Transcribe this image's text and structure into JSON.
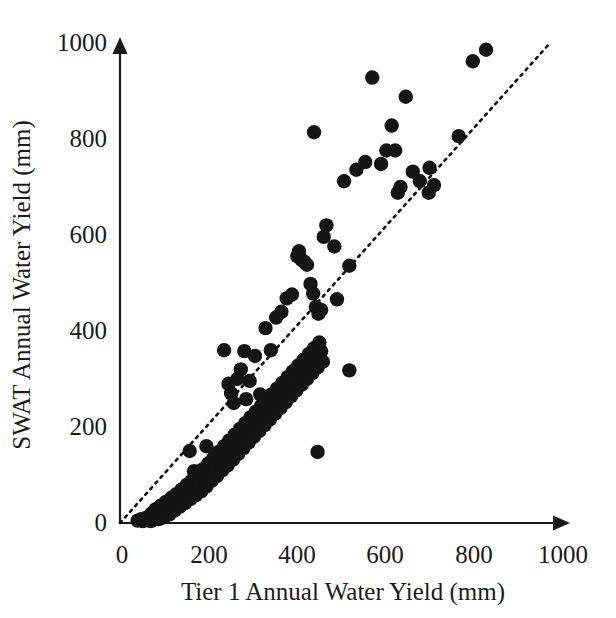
{
  "figure": {
    "background_color": "#ffffff",
    "point_color": "#151515",
    "axis_color": "#1a1a1a",
    "line_color": "#111111"
  },
  "axes": {
    "x_title": "Tier 1 Annual Water Yield (mm)",
    "y_title": "SWAT Annual Water Yield (mm)",
    "x_ticks": [
      "0",
      "200",
      "400",
      "600",
      "800",
      "1000"
    ],
    "y_ticks": [
      "0",
      "200",
      "400",
      "600",
      "800",
      "1000"
    ]
  },
  "chart_data": {
    "type": "scatter",
    "title": "",
    "xlabel": "Tier 1 Annual Water Yield (mm)",
    "ylabel": "SWAT Annual Water Yield (mm)",
    "xlim": [
      0,
      1000
    ],
    "ylim": [
      0,
      1000
    ],
    "xticks": [
      0,
      200,
      400,
      600,
      800,
      1000
    ],
    "yticks": [
      0,
      200,
      400,
      600,
      800,
      1000
    ],
    "grid": false,
    "legend": null,
    "annotations": [
      {
        "name": "one-to-one-line",
        "style": "dotted",
        "from": [
          0,
          0
        ],
        "to": [
          975,
          1000
        ]
      }
    ],
    "series": [
      {
        "name": "Watershed annual water yield",
        "marker": "filled-circle",
        "color": "#151515",
        "points": [
          [
            40,
            5
          ],
          [
            48,
            8
          ],
          [
            52,
            4
          ],
          [
            58,
            10
          ],
          [
            62,
            6
          ],
          [
            66,
            14
          ],
          [
            70,
            4
          ],
          [
            72,
            20
          ],
          [
            76,
            10
          ],
          [
            80,
            28
          ],
          [
            84,
            16
          ],
          [
            88,
            8
          ],
          [
            92,
            36
          ],
          [
            96,
            22
          ],
          [
            100,
            12
          ],
          [
            104,
            44
          ],
          [
            108,
            30
          ],
          [
            112,
            18
          ],
          [
            116,
            52
          ],
          [
            120,
            38
          ],
          [
            124,
            26
          ],
          [
            128,
            60
          ],
          [
            132,
            46
          ],
          [
            136,
            34
          ],
          [
            140,
            70
          ],
          [
            144,
            54
          ],
          [
            148,
            42
          ],
          [
            152,
            80
          ],
          [
            156,
            62
          ],
          [
            160,
            50
          ],
          [
            164,
            90
          ],
          [
            168,
            74
          ],
          [
            172,
            58
          ],
          [
            176,
            100
          ],
          [
            180,
            84
          ],
          [
            184,
            66
          ],
          [
            188,
            112
          ],
          [
            192,
            96
          ],
          [
            196,
            76
          ],
          [
            200,
            124
          ],
          [
            204,
            106
          ],
          [
            208,
            88
          ],
          [
            212,
            136
          ],
          [
            216,
            118
          ],
          [
            220,
            98
          ],
          [
            224,
            148
          ],
          [
            228,
            130
          ],
          [
            232,
            110
          ],
          [
            236,
            160
          ],
          [
            240,
            142
          ],
          [
            244,
            120
          ],
          [
            248,
            172
          ],
          [
            252,
            154
          ],
          [
            256,
            132
          ],
          [
            260,
            184
          ],
          [
            264,
            166
          ],
          [
            268,
            144
          ],
          [
            272,
            196
          ],
          [
            276,
            178
          ],
          [
            280,
            156
          ],
          [
            284,
            208
          ],
          [
            288,
            190
          ],
          [
            292,
            168
          ],
          [
            296,
            220
          ],
          [
            300,
            202
          ],
          [
            304,
            180
          ],
          [
            308,
            232
          ],
          [
            312,
            214
          ],
          [
            316,
            192
          ],
          [
            320,
            244
          ],
          [
            324,
            226
          ],
          [
            328,
            204
          ],
          [
            332,
            256
          ],
          [
            336,
            238
          ],
          [
            340,
            216
          ],
          [
            344,
            268
          ],
          [
            348,
            250
          ],
          [
            352,
            228
          ],
          [
            356,
            280
          ],
          [
            360,
            262
          ],
          [
            364,
            240
          ],
          [
            368,
            292
          ],
          [
            372,
            274
          ],
          [
            376,
            252
          ],
          [
            380,
            304
          ],
          [
            384,
            286
          ],
          [
            388,
            264
          ],
          [
            392,
            316
          ],
          [
            396,
            298
          ],
          [
            400,
            276
          ],
          [
            404,
            328
          ],
          [
            408,
            310
          ],
          [
            412,
            288
          ],
          [
            416,
            340
          ],
          [
            420,
            322
          ],
          [
            424,
            300
          ],
          [
            428,
            352
          ],
          [
            432,
            334
          ],
          [
            436,
            312
          ],
          [
            440,
            364
          ],
          [
            444,
            346
          ],
          [
            448,
            324
          ],
          [
            452,
            376
          ],
          [
            456,
            358
          ],
          [
            460,
            336
          ],
          [
            236,
            360
          ],
          [
            246,
            290
          ],
          [
            252,
            270
          ],
          [
            258,
            250
          ],
          [
            266,
            300
          ],
          [
            274,
            320
          ],
          [
            286,
            258
          ],
          [
            294,
            296
          ],
          [
            306,
            348
          ],
          [
            318,
            268
          ],
          [
            330,
            406
          ],
          [
            342,
            360
          ],
          [
            354,
            428
          ],
          [
            366,
            440
          ],
          [
            378,
            468
          ],
          [
            390,
            476
          ],
          [
            402,
            556
          ],
          [
            406,
            566
          ],
          [
            412,
            548
          ],
          [
            418,
            544
          ],
          [
            424,
            538
          ],
          [
            432,
            498
          ],
          [
            438,
            478
          ],
          [
            444,
            450
          ],
          [
            450,
            436
          ],
          [
            456,
            444
          ],
          [
            462,
            596
          ],
          [
            440,
            814
          ],
          [
            468,
            620
          ],
          [
            486,
            576
          ],
          [
            492,
            466
          ],
          [
            508,
            712
          ],
          [
            520,
            536
          ],
          [
            536,
            736
          ],
          [
            556,
            752
          ],
          [
            572,
            928
          ],
          [
            592,
            748
          ],
          [
            604,
            776
          ],
          [
            616,
            828
          ],
          [
            624,
            776
          ],
          [
            630,
            688
          ],
          [
            636,
            700
          ],
          [
            648,
            888
          ],
          [
            664,
            732
          ],
          [
            680,
            712
          ],
          [
            702,
            740
          ],
          [
            712,
            704
          ],
          [
            700,
            688
          ],
          [
            768,
            806
          ],
          [
            800,
            962
          ],
          [
            830,
            986
          ],
          [
            520,
            318
          ],
          [
            448,
            148
          ],
          [
            282,
            358
          ],
          [
            196,
            160
          ],
          [
            158,
            150
          ],
          [
            168,
            108
          ]
        ]
      }
    ]
  }
}
